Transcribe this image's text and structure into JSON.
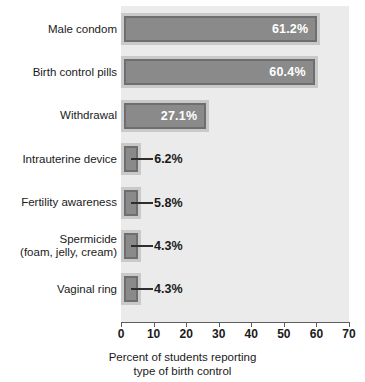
{
  "chart_data": {
    "type": "bar",
    "orientation": "horizontal",
    "title": "",
    "xlabel_line1": "Percent of students reporting",
    "xlabel_line2": "type of birth control",
    "ylabel": "",
    "xlim": [
      0,
      70
    ],
    "xticks": [
      0,
      10,
      20,
      30,
      40,
      50,
      60,
      70
    ],
    "xtick_labels": [
      "0",
      "10",
      "20",
      "30",
      "40",
      "50",
      "60",
      "70"
    ],
    "grid": false,
    "legend": "none",
    "categories": [
      "Male condom",
      "Birth control pills",
      "Withdrawal",
      "Intrauterine device",
      "Fertility awareness",
      "Spermicide\n(foam, jelly, cream)",
      "Vaginal ring"
    ],
    "category_lines": [
      [
        "Male condom"
      ],
      [
        "Birth control pills"
      ],
      [
        "Withdrawal"
      ],
      [
        "Intrauterine device"
      ],
      [
        "Fertility awareness"
      ],
      [
        "Spermicide",
        "(foam, jelly, cream)"
      ],
      [
        "Vaginal ring"
      ]
    ],
    "values": [
      61.2,
      60.4,
      27.1,
      6.2,
      5.8,
      4.3,
      4.3
    ],
    "value_labels": [
      "61.2%",
      "60.4%",
      "27.1%",
      "6.2%",
      "5.8%",
      "4.3%",
      "4.3%"
    ],
    "label_placement": [
      "inside",
      "inside",
      "inside",
      "outside",
      "outside",
      "outside",
      "outside"
    ],
    "colors": {
      "bar_fill": "#8a8a8a",
      "bar_inner_border": "#6e6e6e",
      "bar_outer_border": "#c9c9c9",
      "plot_background": "#ebebeb",
      "axis": "#5d5d5d",
      "text": "#1a1a1a",
      "inside_label_text": "#ffffff"
    }
  }
}
